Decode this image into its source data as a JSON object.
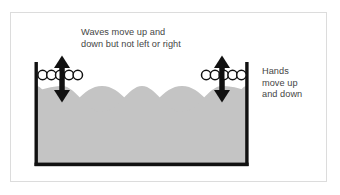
{
  "figure": {
    "type": "diagram",
    "background_color": "#ffffff",
    "frame_color": "#dcdcdc"
  },
  "annotations": {
    "waves_label": "Waves move up and\ndown but not left or right",
    "hands_label": "Hands\nmove up\nand down",
    "text_color": "#454545"
  },
  "tank": {
    "wall_color": "#111111",
    "water_color": "#c4c4c4",
    "left_wall_x": 36,
    "right_wall_x": 247,
    "top_y": 62,
    "bottom_y": 165
  },
  "water_surface": {
    "crest_xs": [
      62,
      142,
      222
    ],
    "trough_xs": [
      102,
      182
    ],
    "crest_y": 86,
    "trough_y": 112
  },
  "hands": [
    {
      "side": "left",
      "arrow_x": 62,
      "arrow_top_y": 57,
      "arrow_bottom_y": 101,
      "fingers_count": 5,
      "fingers_start_x": 40,
      "fingers_y": 75,
      "finger_radius": 4.6,
      "finger_fill": "#ffffff",
      "finger_stroke": "#111111"
    },
    {
      "side": "right",
      "arrow_x": 222,
      "arrow_top_y": 57,
      "arrow_bottom_y": 101,
      "fingers_count": 5,
      "fingers_start_x": 205,
      "fingers_y": 75,
      "finger_radius": 4.6,
      "finger_fill": "#ffffff",
      "finger_stroke": "#111111"
    }
  ],
  "arrows": {
    "color": "#111111",
    "shaft_width": 5,
    "head_width": 15,
    "head_height": 11,
    "direction": "double-vertical"
  }
}
